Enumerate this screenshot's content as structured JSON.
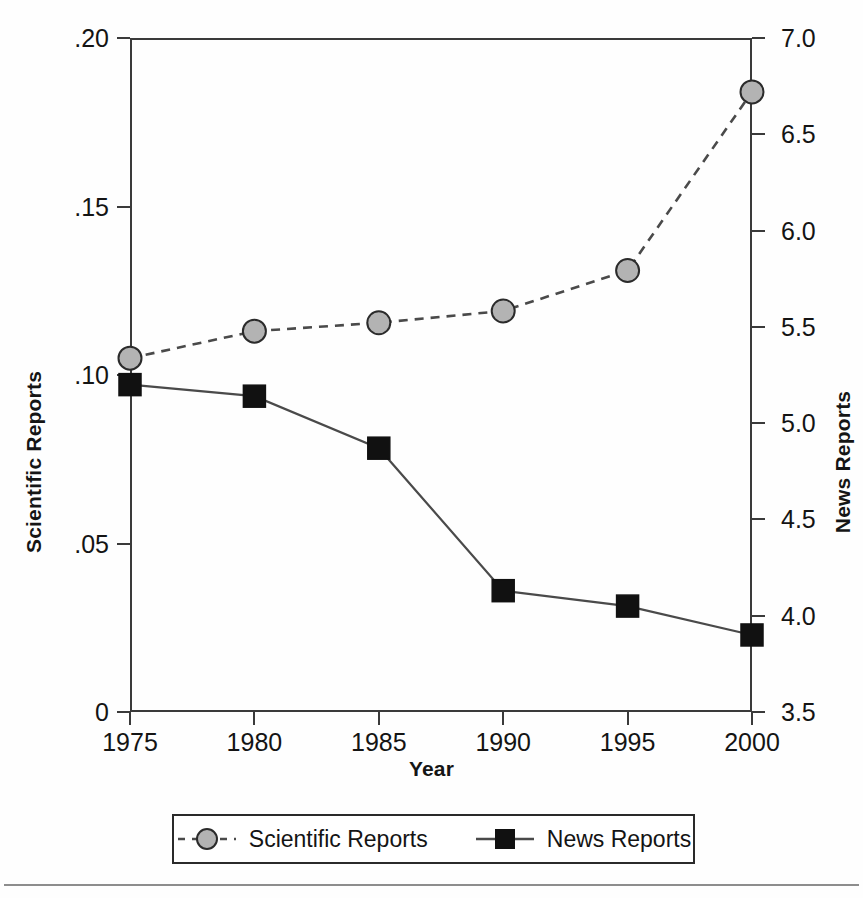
{
  "axes": {
    "x_title": "Year",
    "y_left_title": "Scientific Reports",
    "y_right_title": "News Reports",
    "x_ticks": [
      "1975",
      "1980",
      "1985",
      "1990",
      "1995",
      "2000"
    ],
    "y_left_ticks": [
      ".20",
      ".15",
      ".10",
      ".05",
      "0"
    ],
    "y_right_ticks": [
      "7.0",
      "6.5",
      "6.0",
      "5.5",
      "5.0",
      "4.5",
      "4.0",
      "3.5"
    ]
  },
  "legend": {
    "entries": [
      {
        "label": "Scientific Reports",
        "marker": "circle-marker",
        "line": "dashed",
        "color": "#b0b0b0"
      },
      {
        "label": "News Reports",
        "marker": "square-marker",
        "line": "solid",
        "color": "#111111"
      }
    ]
  },
  "colors": {
    "scientific_marker_fill": "#b3b3b3",
    "scientific_marker_stroke": "#2b2b2b",
    "news_marker_fill": "#111111",
    "news_marker_stroke": "#111111",
    "axis": "#3a3a3a",
    "line": "#4a4a4a"
  },
  "chart_data": {
    "type": "line",
    "title": "",
    "xlabel": "Year",
    "ylabel": "Scientific Reports",
    "y2label": "News Reports",
    "x": [
      1975,
      1980,
      1985,
      1990,
      1995,
      2000
    ],
    "categories": [
      "1975",
      "1980",
      "1985",
      "1990",
      "1995",
      "2000"
    ],
    "xlim": [
      1975,
      2000
    ],
    "ylim": [
      0,
      0.2
    ],
    "y2lim": [
      3.5,
      7.0
    ],
    "yticks": [
      0,
      0.05,
      0.1,
      0.15,
      0.2
    ],
    "y2ticks": [
      3.5,
      4.0,
      4.5,
      5.0,
      5.5,
      6.0,
      6.5,
      7.0
    ],
    "grid": false,
    "legend_position": "bottom",
    "series": [
      {
        "name": "Scientific Reports",
        "axis": "left",
        "marker": "circle",
        "linestyle": "dashed",
        "color": "#b3b3b3",
        "values": [
          0.105,
          0.113,
          0.1155,
          0.119,
          0.131,
          0.184
        ]
      },
      {
        "name": "News Reports",
        "axis": "right",
        "marker": "square",
        "linestyle": "solid",
        "color": "#111111",
        "values": [
          5.2,
          5.14,
          4.87,
          4.13,
          4.05,
          3.9
        ]
      }
    ]
  }
}
